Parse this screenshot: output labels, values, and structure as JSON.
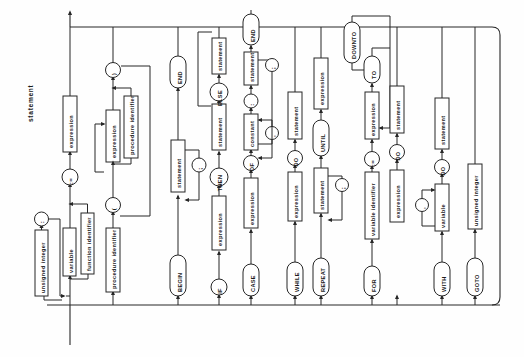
{
  "diagram": {
    "title": "statement",
    "kind": "railroad-syntax-diagram",
    "language": "Pascal",
    "orientation": "rotated-90-ccw",
    "rail": {
      "entry_label": "statement",
      "color": "#222222"
    },
    "nodes": {
      "unsigned_integer_label": "unsigned integer",
      "colon": ":",
      "variable": "variable",
      "function_identifier": "function identifier",
      "assign": ":=",
      "expression": "expression",
      "procedure_identifier": "procedure identifier",
      "lparen": "(",
      "rparen": ")",
      "comma": ",",
      "semicolon": ";",
      "begin": "BEGIN",
      "statement": "statement",
      "end": "END",
      "if": "IF",
      "then": "THEN",
      "else": "ELSE",
      "case": "CASE",
      "of": "OF",
      "constant": "constant",
      "while": "WHILE",
      "do": "DO",
      "repeat": "REPEAT",
      "until": "UNTIL",
      "for": "FOR",
      "variable_identifier": "variable identifier",
      "to": "TO",
      "downto": "DOWNTO",
      "with": "WITH",
      "goto": "GOTO",
      "unsigned_integer": "unsigned integer"
    },
    "branches": [
      {
        "id": "assignment",
        "label": "assignment statement",
        "sequence": [
          "variable",
          "function identifier",
          ":=",
          "expression"
        ]
      },
      {
        "id": "procedure-call",
        "label": "procedure statement",
        "sequence": [
          "procedure identifier",
          "(",
          "expression",
          "procedure identifier",
          ")"
        ]
      },
      {
        "id": "compound",
        "label": "compound statement",
        "sequence": [
          "BEGIN",
          "statement",
          ";",
          "END"
        ]
      },
      {
        "id": "if",
        "label": "if statement",
        "sequence": [
          "IF",
          "expression",
          "THEN",
          "statement",
          "ELSE",
          "statement"
        ]
      },
      {
        "id": "case",
        "label": "case statement",
        "sequence": [
          "CASE",
          "expression",
          "OF",
          "constant",
          ",",
          ":",
          "statement",
          ";",
          "END"
        ]
      },
      {
        "id": "while",
        "label": "while statement",
        "sequence": [
          "WHILE",
          "expression",
          "DO",
          "statement"
        ]
      },
      {
        "id": "repeat",
        "label": "repeat statement",
        "sequence": [
          "REPEAT",
          "statement",
          ";",
          "UNTIL",
          "expression"
        ]
      },
      {
        "id": "for",
        "label": "for statement",
        "sequence": [
          "FOR",
          "variable identifier",
          ":=",
          "expression",
          "TO",
          "DOWNTO",
          "expression",
          "DO",
          "statement"
        ]
      },
      {
        "id": "with",
        "label": "with statement",
        "sequence": [
          "WITH",
          "variable",
          ",",
          "DO",
          "statement"
        ]
      },
      {
        "id": "goto",
        "label": "goto statement",
        "sequence": [
          "GOTO",
          "unsigned integer"
        ]
      },
      {
        "id": "empty",
        "label": "empty statement",
        "sequence": []
      }
    ],
    "prefix": {
      "label_part": [
        "unsigned integer",
        ":"
      ]
    }
  }
}
